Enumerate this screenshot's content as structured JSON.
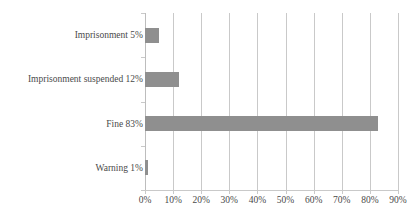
{
  "chart_data": {
    "type": "bar",
    "orientation": "horizontal",
    "title": "",
    "xlabel": "",
    "ylabel": "",
    "categories": [
      "Imprisonment 5%",
      "Imprisonment suspended 12%",
      "Fine 83%",
      "Warning 1%"
    ],
    "values": [
      5,
      12,
      83,
      1
    ],
    "value_unit": "%",
    "xlim": [
      0,
      90
    ],
    "xticks": [
      0,
      10,
      20,
      30,
      40,
      50,
      60,
      70,
      80,
      90
    ],
    "xtick_labels": [
      "0%",
      "10%",
      "20%",
      "30%",
      "40%",
      "50%",
      "60%",
      "70%",
      "80%",
      "90%"
    ],
    "grid": "vertical",
    "legend": "none",
    "series": [
      {
        "name": "Share of sanctions",
        "color": "#8f8f8f",
        "values": [
          5,
          12,
          83,
          1
        ]
      }
    ]
  },
  "colors": {
    "bar": "#8f8f8f",
    "gridline": "#c9c9c9",
    "text": "#4a4a4a",
    "background": "#ffffff"
  }
}
